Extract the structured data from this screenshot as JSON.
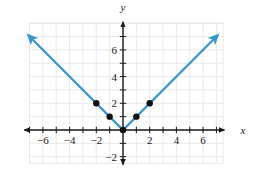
{
  "figure": {
    "background_color": "#ffffff",
    "grid_color": "#e9e7e8",
    "axis_color": "#1a1a1a",
    "curve_color": "#3a96cf",
    "point_color": "#111111"
  },
  "axes": {
    "x_axis_label": "x",
    "y_axis_label": "y",
    "x_ticks": [
      {
        "value": -6,
        "label": "−6"
      },
      {
        "value": -4,
        "label": "−4"
      },
      {
        "value": -2,
        "label": "−2"
      },
      {
        "value": 2,
        "label": "2"
      },
      {
        "value": 4,
        "label": "4"
      },
      {
        "value": 6,
        "label": "6"
      }
    ],
    "y_ticks": [
      {
        "value": 6,
        "label": "6"
      },
      {
        "value": 4,
        "label": "4"
      },
      {
        "value": 2,
        "label": "2"
      },
      {
        "value": -2,
        "label": "−2"
      }
    ],
    "x_minor_ticks": [
      -7,
      -6,
      -5,
      -4,
      -3,
      -2,
      -1,
      1,
      2,
      3,
      4,
      5,
      6,
      7
    ],
    "y_minor_ticks": [
      -2,
      -1,
      1,
      2,
      3,
      4,
      5,
      6,
      7
    ],
    "xlim": [
      -7.4,
      7.6
    ],
    "ylim": [
      -2.6,
      8.1
    ],
    "grid": true,
    "grid_xlim": [
      -7,
      7.5
    ],
    "grid_ylim": [
      -2.5,
      8
    ]
  },
  "chart_data": {
    "type": "line",
    "title": "",
    "xlabel": "x",
    "ylabel": "y",
    "xlim": [
      -7.4,
      7.6
    ],
    "ylim": [
      -2.6,
      8.1
    ],
    "grid": true,
    "legend": null,
    "series": [
      {
        "name": "y = |x|",
        "equation": "y = |x|",
        "color": "#3a96cf",
        "arrow_start": true,
        "arrow_end": true,
        "x": [
          -7.0,
          0,
          7.0
        ],
        "y": [
          7.0,
          0,
          7.0
        ]
      }
    ],
    "points": [
      {
        "x": -2,
        "y": 2
      },
      {
        "x": -1,
        "y": 1
      },
      {
        "x": 0,
        "y": 0
      },
      {
        "x": 1,
        "y": 1
      },
      {
        "x": 2,
        "y": 2
      }
    ]
  }
}
